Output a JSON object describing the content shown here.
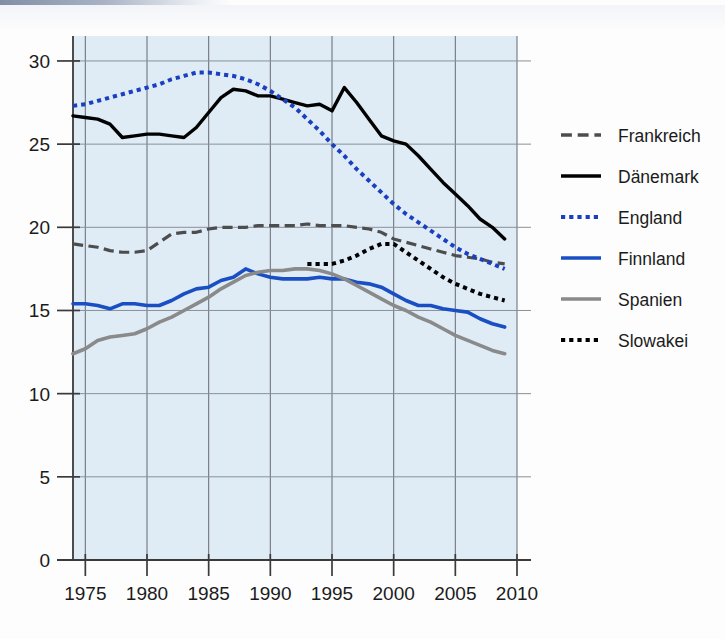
{
  "chart_data": {
    "type": "line",
    "title": "",
    "subtitle": "",
    "xlabel": "",
    "ylabel": "",
    "xlim": [
      1974,
      2010
    ],
    "ylim": [
      0,
      31.5
    ],
    "x_ticks": [
      1975,
      1980,
      1985,
      1990,
      1995,
      2000,
      2005,
      2010
    ],
    "y_ticks": [
      0,
      5,
      10,
      15,
      20,
      25,
      30
    ],
    "grid": true,
    "legend_position": "right",
    "plot_background": "#dfecf6",
    "series": [
      {
        "name": "Frankreich",
        "color": "#4d4d4d",
        "style": "dashed",
        "width": 3.2,
        "x": [
          1974,
          1975,
          1976,
          1977,
          1978,
          1979,
          1980,
          1981,
          1982,
          1983,
          1984,
          1985,
          1986,
          1987,
          1988,
          1989,
          1990,
          1991,
          1992,
          1993,
          1994,
          1995,
          1996,
          1997,
          1998,
          1999,
          2000,
          2001,
          2002,
          2003,
          2004,
          2005,
          2006,
          2007,
          2008,
          2009
        ],
        "values": [
          19.0,
          18.9,
          18.8,
          18.6,
          18.5,
          18.5,
          18.6,
          19.1,
          19.6,
          19.7,
          19.7,
          19.9,
          20.0,
          20.0,
          20.0,
          20.1,
          20.1,
          20.1,
          20.1,
          20.2,
          20.1,
          20.1,
          20.1,
          20.0,
          19.9,
          19.7,
          19.3,
          19.1,
          18.9,
          18.7,
          18.5,
          18.3,
          18.2,
          18.1,
          17.9,
          17.8
        ]
      },
      {
        "name": "Dänemark",
        "color": "#000000",
        "style": "solid",
        "width": 3.4,
        "x": [
          1974,
          1975,
          1976,
          1977,
          1978,
          1979,
          1980,
          1981,
          1982,
          1983,
          1984,
          1985,
          1986,
          1987,
          1988,
          1989,
          1990,
          1991,
          1992,
          1993,
          1994,
          1995,
          1996,
          1997,
          1998,
          1999,
          2000,
          2001,
          2002,
          2003,
          2004,
          2005,
          2006,
          2007,
          2008,
          2009
        ],
        "values": [
          26.7,
          26.6,
          26.5,
          26.2,
          25.4,
          25.5,
          25.6,
          25.6,
          25.5,
          25.4,
          26.0,
          26.9,
          27.8,
          28.3,
          28.2,
          27.9,
          27.9,
          27.7,
          27.5,
          27.3,
          27.4,
          27.0,
          28.4,
          27.5,
          26.5,
          25.5,
          25.2,
          25.0,
          24.3,
          23.5,
          22.7,
          22.0,
          21.3,
          20.5,
          20.0,
          19.3
        ]
      },
      {
        "name": "England",
        "color": "#1a3fc0",
        "style": "dotted",
        "width": 4.0,
        "x": [
          1974,
          1975,
          1976,
          1977,
          1978,
          1979,
          1980,
          1981,
          1982,
          1983,
          1984,
          1985,
          1986,
          1987,
          1988,
          1989,
          1990,
          1991,
          1992,
          1993,
          1994,
          1995,
          1996,
          1997,
          1998,
          1999,
          2000,
          2001,
          2002,
          2003,
          2004,
          2005,
          2006,
          2007,
          2008,
          2009
        ],
        "values": [
          27.3,
          27.4,
          27.6,
          27.8,
          28.0,
          28.2,
          28.4,
          28.6,
          28.9,
          29.1,
          29.3,
          29.3,
          29.2,
          29.1,
          28.9,
          28.6,
          28.2,
          27.7,
          27.2,
          26.5,
          25.8,
          25.0,
          24.3,
          23.5,
          22.8,
          22.1,
          21.4,
          20.8,
          20.3,
          19.8,
          19.3,
          18.8,
          18.4,
          18.1,
          17.8,
          17.5
        ]
      },
      {
        "name": "Finnland",
        "color": "#1a4fc4",
        "style": "solid",
        "width": 3.6,
        "x": [
          1974,
          1975,
          1976,
          1977,
          1978,
          1979,
          1980,
          1981,
          1982,
          1983,
          1984,
          1985,
          1986,
          1987,
          1988,
          1989,
          1990,
          1991,
          1992,
          1993,
          1994,
          1995,
          1996,
          1997,
          1998,
          1999,
          2000,
          2001,
          2002,
          2003,
          2004,
          2005,
          2006,
          2007,
          2008,
          2009
        ],
        "values": [
          15.4,
          15.4,
          15.3,
          15.1,
          15.4,
          15.4,
          15.3,
          15.3,
          15.6,
          16.0,
          16.3,
          16.4,
          16.8,
          17.0,
          17.5,
          17.2,
          17.0,
          16.9,
          16.9,
          16.9,
          17.0,
          16.9,
          16.9,
          16.7,
          16.6,
          16.4,
          16.0,
          15.6,
          15.3,
          15.3,
          15.1,
          15.0,
          14.9,
          14.5,
          14.2,
          14.0
        ]
      },
      {
        "name": "Spanien",
        "color": "#8a8a8a",
        "style": "solid",
        "width": 3.6,
        "x": [
          1974,
          1975,
          1976,
          1977,
          1978,
          1979,
          1980,
          1981,
          1982,
          1983,
          1984,
          1985,
          1986,
          1987,
          1988,
          1989,
          1990,
          1991,
          1992,
          1993,
          1994,
          1995,
          1996,
          1997,
          1998,
          1999,
          2000,
          2001,
          2002,
          2003,
          2004,
          2005,
          2006,
          2007,
          2008,
          2009
        ],
        "values": [
          12.4,
          12.7,
          13.2,
          13.4,
          13.5,
          13.6,
          13.9,
          14.3,
          14.6,
          15.0,
          15.4,
          15.8,
          16.3,
          16.7,
          17.1,
          17.3,
          17.4,
          17.4,
          17.5,
          17.5,
          17.4,
          17.2,
          16.9,
          16.5,
          16.1,
          15.7,
          15.3,
          15.0,
          14.6,
          14.3,
          13.9,
          13.5,
          13.2,
          12.9,
          12.6,
          12.4
        ]
      },
      {
        "name": "Slowakei",
        "color": "#000000",
        "style": "dotted",
        "width": 4.0,
        "x": [
          1993,
          1994,
          1995,
          1996,
          1997,
          1998,
          1999,
          2000,
          2001,
          2002,
          2003,
          2004,
          2005,
          2006,
          2007,
          2008,
          2009
        ],
        "values": [
          17.8,
          17.8,
          17.8,
          18.0,
          18.3,
          18.7,
          19.0,
          19.0,
          18.5,
          18.0,
          17.5,
          17.0,
          16.6,
          16.3,
          16.0,
          15.8,
          15.6
        ]
      }
    ]
  },
  "legend": {
    "items": [
      {
        "label": "Frankreich"
      },
      {
        "label": "Dänemark"
      },
      {
        "label": "England"
      },
      {
        "label": "Finnland"
      },
      {
        "label": "Spanien"
      },
      {
        "label": "Slowakei"
      }
    ]
  },
  "axis": {
    "y_tick_labels": [
      "30",
      "25",
      "20",
      "15",
      "10",
      "5",
      "0"
    ],
    "x_tick_labels": [
      "1975",
      "1980",
      "1985",
      "1990",
      "1995",
      "2000",
      "2005",
      "2010"
    ]
  }
}
